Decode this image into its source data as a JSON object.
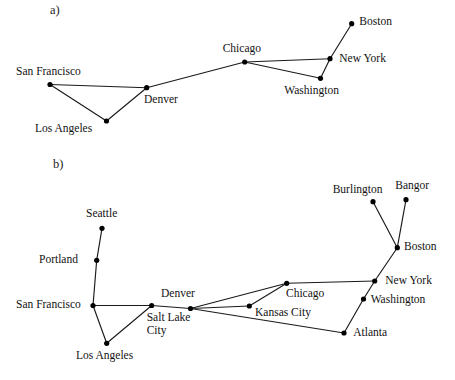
{
  "figure": {
    "background_color": "#ffffff",
    "line_color": "#1a1a1a",
    "node_color": "#000000",
    "width": 455,
    "height": 380
  },
  "panels": [
    {
      "id": "a",
      "label": "a)",
      "label_x": 50,
      "label_y": 3,
      "nodes": [
        {
          "name": "San Francisco",
          "x": 50,
          "y": 84.5,
          "label": "San Francisco",
          "label_x": 16,
          "label_y": 66,
          "r": 2.6
        },
        {
          "name": "Los Angeles",
          "x": 106.5,
          "y": 121,
          "label": "Los Angeles",
          "label_x": 35,
          "label_y": 123,
          "r": 2.6
        },
        {
          "name": "Denver",
          "x": 146.7,
          "y": 87.7,
          "label": "Denver",
          "label_x": 144,
          "label_y": 94,
          "r": 2.6
        },
        {
          "name": "Chicago",
          "x": 244.7,
          "y": 62,
          "label": "Chicago",
          "label_x": 222.7,
          "label_y": 42.5,
          "r": 2.6
        },
        {
          "name": "Washington",
          "x": 320.5,
          "y": 78.3,
          "label": "Washington",
          "label_x": 284.3,
          "label_y": 85,
          "r": 2.6
        },
        {
          "name": "New York",
          "x": 330,
          "y": 58.7,
          "label": "New York",
          "label_x": 339.3,
          "label_y": 52.5,
          "r": 2.6
        },
        {
          "name": "Boston",
          "x": 351.7,
          "y": 23.7,
          "label": "Boston",
          "label_x": 359.3,
          "label_y": 16,
          "r": 2.6
        }
      ],
      "edges": [
        [
          "San Francisco",
          "Denver"
        ],
        [
          "San Francisco",
          "Los Angeles"
        ],
        [
          "Los Angeles",
          "Denver"
        ],
        [
          "Denver",
          "Chicago"
        ],
        [
          "Chicago",
          "New York"
        ],
        [
          "Chicago",
          "Washington"
        ],
        [
          "Washington",
          "New York"
        ],
        [
          "New York",
          "Boston"
        ]
      ]
    },
    {
      "id": "b",
      "label": "b)",
      "label_x": 53,
      "label_y": 157,
      "nodes": [
        {
          "name": "Seattle",
          "x": 102,
          "y": 228.3,
          "label": "Seattle",
          "label_x": 86,
          "label_y": 207.5,
          "r": 2.6
        },
        {
          "name": "Portland",
          "x": 96.7,
          "y": 260.3,
          "label": "Portland",
          "label_x": 39,
          "label_y": 253.5,
          "r": 2.6
        },
        {
          "name": "San Francisco",
          "x": 93,
          "y": 305.5,
          "label": "San Francisco",
          "label_x": 16,
          "label_y": 299,
          "r": 2.6
        },
        {
          "name": "Los Angeles",
          "x": 106.7,
          "y": 343.3,
          "label": "Los Angeles",
          "label_x": 76,
          "label_y": 350,
          "r": 2.6
        },
        {
          "name": "Salt Lake City",
          "x": 151.7,
          "y": 305.5,
          "label": "Salt Lake",
          "label_x": 146.7,
          "label_y": 312,
          "r": 2.6,
          "label2": "City",
          "label2_x": 146.7,
          "label2_y": 324
        },
        {
          "name": "Denver",
          "x": 190.5,
          "y": 308.5,
          "label": "Denver",
          "label_x": 161,
          "label_y": 288,
          "r": 2.6
        },
        {
          "name": "Kansas City",
          "x": 249.3,
          "y": 306,
          "label": "Kansas City",
          "label_x": 255,
          "label_y": 307,
          "r": 2.6
        },
        {
          "name": "Chicago",
          "x": 286.7,
          "y": 283.3,
          "label": "Chicago",
          "label_x": 286,
          "label_y": 288,
          "r": 2.6
        },
        {
          "name": "Atlanta",
          "x": 344,
          "y": 333,
          "label": "Atlanta",
          "label_x": 353.3,
          "label_y": 327,
          "r": 2.6
        },
        {
          "name": "Washington",
          "x": 363.5,
          "y": 299,
          "label": "Washington",
          "label_x": 370.7,
          "label_y": 293.5,
          "r": 2.6
        },
        {
          "name": "New York",
          "x": 374.7,
          "y": 281,
          "label": "New York",
          "label_x": 385.3,
          "label_y": 275,
          "r": 2.6
        },
        {
          "name": "Boston",
          "x": 397.3,
          "y": 247.7,
          "label": "Boston",
          "label_x": 404,
          "label_y": 240.5,
          "r": 2.6
        },
        {
          "name": "Burlington",
          "x": 373,
          "y": 201.7,
          "label": "Burlington",
          "label_x": 332.7,
          "label_y": 184,
          "r": 2.6
        },
        {
          "name": "Bangor",
          "x": 406,
          "y": 199.7,
          "label": "Bangor",
          "label_x": 395.3,
          "label_y": 180,
          "r": 2.6
        }
      ],
      "edges": [
        [
          "Seattle",
          "Portland"
        ],
        [
          "Portland",
          "San Francisco"
        ],
        [
          "San Francisco",
          "Los Angeles"
        ],
        [
          "San Francisco",
          "Salt Lake City"
        ],
        [
          "Los Angeles",
          "Salt Lake City"
        ],
        [
          "Salt Lake City",
          "Denver"
        ],
        [
          "Denver",
          "Chicago"
        ],
        [
          "Denver",
          "Kansas City"
        ],
        [
          "Denver",
          "Atlanta"
        ],
        [
          "Kansas City",
          "Chicago"
        ],
        [
          "Chicago",
          "New York"
        ],
        [
          "Atlanta",
          "Washington"
        ],
        [
          "Washington",
          "New York"
        ],
        [
          "New York",
          "Boston"
        ],
        [
          "Boston",
          "Burlington"
        ],
        [
          "Boston",
          "Bangor"
        ]
      ]
    }
  ]
}
